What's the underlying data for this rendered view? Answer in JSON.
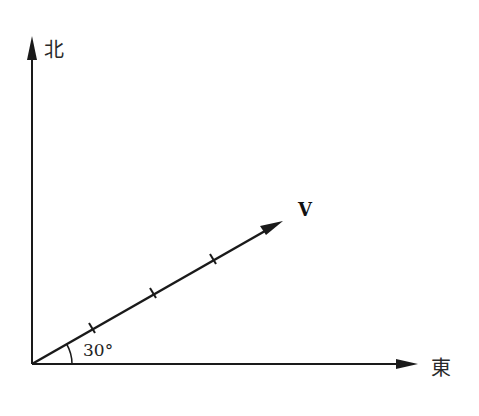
{
  "diagram": {
    "type": "vector-direction-diagram",
    "axes": {
      "north_label": "北",
      "east_label": "東"
    },
    "vector": {
      "label": "V",
      "angle_label": "30°",
      "angle_degrees": 30,
      "tick_marks": 3
    },
    "colors": {
      "line": "#1a1a1a",
      "background": "#ffffff"
    }
  }
}
